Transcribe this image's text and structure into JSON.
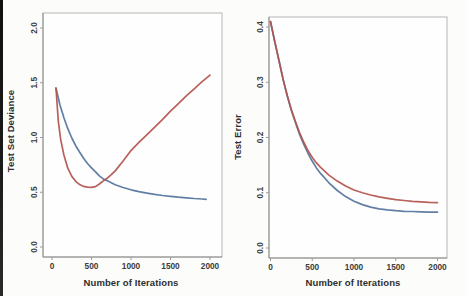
{
  "figure": {
    "background": "#fcfcfa",
    "edge_strip_color": "#181818",
    "frame_color": "#b5b5b5",
    "axis_line_color": "#8f8f8f",
    "tick_color": "#9a9a9a"
  },
  "chart_data": [
    {
      "type": "line",
      "title": "",
      "xlabel": "Number of Iterations",
      "ylabel": "Test Set Deviance",
      "xlim": [
        0,
        2000
      ],
      "ylim": [
        0.0,
        2.0
      ],
      "xticks": [
        0,
        500,
        1000,
        1500,
        2000
      ],
      "yticks": [
        "0.0",
        "0.5",
        "1.0",
        "1.5",
        "2.0"
      ],
      "grid": false,
      "legend": "none",
      "ytick_rotation": -90,
      "series": [
        {
          "name": "blue-curve",
          "color": "#54749c",
          "x": [
            50,
            100,
            150,
            200,
            250,
            300,
            350,
            400,
            450,
            500,
            550,
            600,
            650,
            700,
            750,
            800,
            900,
            1000,
            1100,
            1200,
            1300,
            1400,
            1500,
            1600,
            1700,
            1800,
            1900,
            1950
          ],
          "y": [
            1.45,
            1.3,
            1.18,
            1.08,
            0.995,
            0.925,
            0.865,
            0.81,
            0.763,
            0.722,
            0.687,
            0.65,
            0.622,
            0.605,
            0.586,
            0.569,
            0.543,
            0.522,
            0.505,
            0.492,
            0.48,
            0.47,
            0.462,
            0.455,
            0.449,
            0.443,
            0.438,
            0.435
          ]
        },
        {
          "name": "red-curve",
          "color": "#b2544d",
          "x": [
            50,
            80,
            110,
            150,
            200,
            250,
            300,
            350,
            400,
            450,
            500,
            550,
            600,
            650,
            700,
            750,
            800,
            900,
            1000,
            1100,
            1200,
            1300,
            1400,
            1500,
            1600,
            1700,
            1800,
            1900,
            2000
          ],
          "y": [
            1.45,
            1.15,
            0.98,
            0.84,
            0.72,
            0.645,
            0.6,
            0.57,
            0.553,
            0.546,
            0.545,
            0.552,
            0.575,
            0.605,
            0.628,
            0.66,
            0.695,
            0.785,
            0.88,
            0.955,
            1.025,
            1.095,
            1.165,
            1.24,
            1.31,
            1.38,
            1.445,
            1.51,
            1.57
          ]
        }
      ]
    },
    {
      "type": "line",
      "title": "",
      "xlabel": "Number of Iterations",
      "ylabel": "Test Error",
      "xlim": [
        0,
        2000
      ],
      "ylim": [
        0.0,
        0.4
      ],
      "xticks": [
        0,
        500,
        1000,
        1500,
        2000
      ],
      "yticks": [
        "0.0",
        "0.1",
        "0.2",
        "0.3",
        "0.4"
      ],
      "grid": false,
      "legend": "none",
      "ytick_rotation": -90,
      "series": [
        {
          "name": "blue-curve",
          "color": "#54749c",
          "x": [
            0,
            50,
            100,
            150,
            200,
            250,
            300,
            350,
            400,
            450,
            500,
            550,
            600,
            700,
            800,
            900,
            1000,
            1100,
            1200,
            1300,
            1400,
            1500,
            1600,
            1700,
            1800,
            1900,
            2000
          ],
          "y": [
            0.41,
            0.374,
            0.34,
            0.306,
            0.276,
            0.249,
            0.226,
            0.205,
            0.187,
            0.171,
            0.157,
            0.145,
            0.135,
            0.118,
            0.104,
            0.093,
            0.0845,
            0.0785,
            0.074,
            0.071,
            0.069,
            0.0675,
            0.0665,
            0.066,
            0.0655,
            0.065,
            0.065
          ]
        },
        {
          "name": "red-curve",
          "color": "#b2544d",
          "x": [
            0,
            50,
            100,
            150,
            200,
            250,
            300,
            350,
            400,
            450,
            500,
            550,
            600,
            700,
            800,
            900,
            1000,
            1100,
            1200,
            1300,
            1400,
            1500,
            1600,
            1700,
            1800,
            1900,
            2000
          ],
          "y": [
            0.41,
            0.374,
            0.34,
            0.306,
            0.276,
            0.25,
            0.228,
            0.208,
            0.191,
            0.176,
            0.164,
            0.154,
            0.146,
            0.132,
            0.121,
            0.112,
            0.105,
            0.1,
            0.096,
            0.0925,
            0.09,
            0.0875,
            0.086,
            0.0845,
            0.0835,
            0.0825,
            0.082
          ]
        }
      ]
    }
  ]
}
